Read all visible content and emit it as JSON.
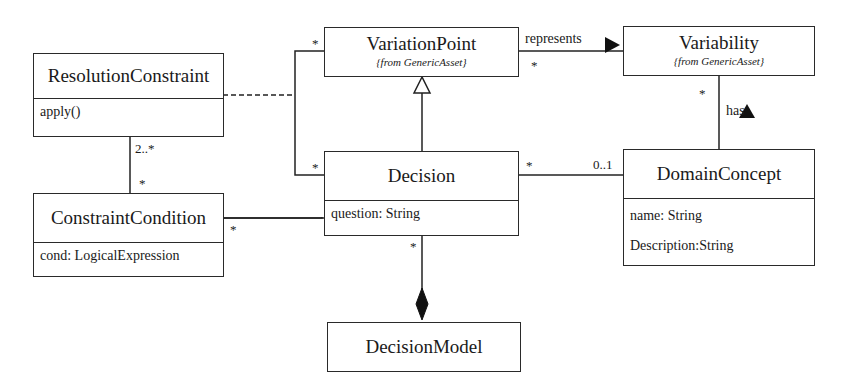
{
  "diagram": {
    "type": "UML class diagram",
    "classes": {
      "resolution_constraint": {
        "name": "ResolutionConstraint",
        "operations": [
          "apply()"
        ]
      },
      "variation_point": {
        "name": "VariationPoint",
        "stereotype": "{from GenericAsset}"
      },
      "variability": {
        "name": "Variability",
        "stereotype": "{from GenericAsset}"
      },
      "decision": {
        "name": "Decision",
        "attributes": [
          "question: String"
        ]
      },
      "domain_concept": {
        "name": "DomainConcept",
        "attributes": [
          "name: String",
          "Description:String"
        ]
      },
      "constraint_condition": {
        "name": "ConstraintCondition",
        "attributes": [
          "cond: LogicalExpression"
        ]
      },
      "decision_model": {
        "name": "DecisionModel"
      }
    },
    "associations": {
      "represents": {
        "label": "represents",
        "from": "VariationPoint",
        "to": "Variability",
        "mult_from": "*",
        "direction": "right"
      },
      "has": {
        "label": "has",
        "from": "DomainConcept",
        "to": "Variability",
        "mult_to": "*",
        "direction": "up"
      },
      "decision_domain": {
        "from": "Decision",
        "to": "DomainConcept",
        "mult_from": "*",
        "mult_to": "0..1"
      },
      "resolution_condition": {
        "from": "ResolutionConstraint",
        "to": "ConstraintCondition",
        "mult_from": "2..*",
        "mult_to": "*"
      },
      "condition_decision": {
        "from": "ConstraintCondition",
        "to": "Decision",
        "mult_from": "*"
      },
      "vp_decision_link": {
        "mult_vp": "*",
        "mult_decision": "*"
      },
      "composition": {
        "whole": "DecisionModel",
        "part": "Decision",
        "mult_part": "*"
      },
      "generalization": {
        "child": "Decision",
        "parent": "VariationPoint"
      }
    }
  }
}
